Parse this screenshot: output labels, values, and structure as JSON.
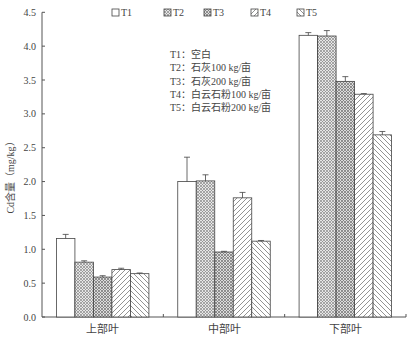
{
  "chart_data": {
    "type": "bar",
    "title": "",
    "xlabel": "",
    "ylabel": "Cd含量（mg/kg）",
    "ylim": [
      0,
      4.5
    ],
    "yticks": [
      "0.0",
      "0.5",
      "1.0",
      "1.5",
      "2.0",
      "2.5",
      "3.0",
      "3.5",
      "4.0",
      "4.5"
    ],
    "grid": false,
    "legend_position": "top",
    "categories": [
      "上部叶",
      "中部叶",
      "下部叶"
    ],
    "series": [
      {
        "name": "T1",
        "pattern": "none",
        "values": [
          1.16,
          2.0,
          4.16
        ],
        "errors": [
          0.06,
          0.36,
          0.04
        ]
      },
      {
        "name": "T2",
        "pattern": "crosshatch",
        "values": [
          0.81,
          2.01,
          4.15
        ],
        "errors": [
          0.02,
          0.09,
          0.08
        ]
      },
      {
        "name": "T3",
        "pattern": "crosshatch",
        "values": [
          0.59,
          0.96,
          3.48
        ],
        "errors": [
          0.02,
          0.01,
          0.07
        ]
      },
      {
        "name": "T4",
        "pattern": "forward-diagonal",
        "values": [
          0.7,
          1.76,
          3.29
        ],
        "errors": [
          0.02,
          0.08,
          0.01
        ]
      },
      {
        "name": "T5",
        "pattern": "backward-diagonal",
        "values": [
          0.64,
          1.12,
          2.69
        ],
        "errors": [
          0.01,
          0.01,
          0.05
        ]
      }
    ],
    "annotations": [
      "T1：空白",
      "T2：石灰100 kg/亩",
      "T3：石灰200 kg/亩",
      "T4：白云石粉100 kg/亩",
      "T5：白云石粉200 kg/亩"
    ]
  },
  "legend": {
    "items": [
      {
        "label": "T1"
      },
      {
        "label": "T2"
      },
      {
        "label": "T3"
      },
      {
        "label": "T4"
      },
      {
        "label": "T5"
      }
    ]
  },
  "colors": {
    "axis": "#555555",
    "bar_stroke": "#444444",
    "hatch": "#666666",
    "background": "#ffffff"
  }
}
